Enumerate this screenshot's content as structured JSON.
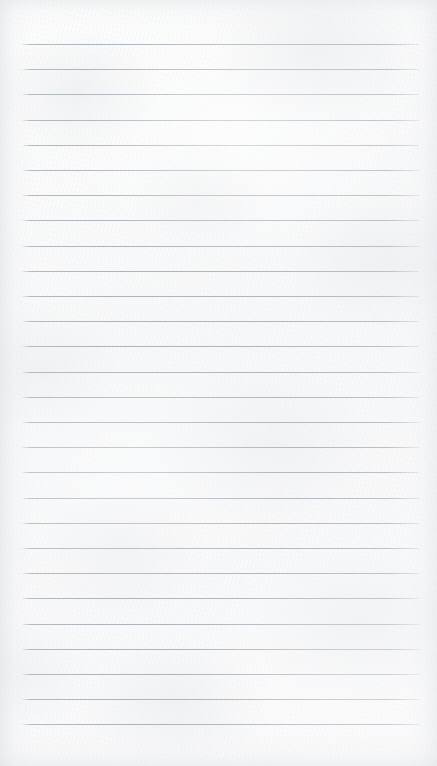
{
  "document": {
    "kind": "ruled-notebook-page",
    "title": "",
    "body_text": "",
    "paper_color": "#fbfbfb",
    "rule_color": "#b0b7bd",
    "page_width": 437,
    "page_height": 766
  },
  "ruling": {
    "line_count": 28,
    "first_line_y": 44,
    "line_spacing": 25.2,
    "line_left_x": 22,
    "line_right_x": 419,
    "line_thickness": 1,
    "has_margin_rule": false,
    "top_margin": 44,
    "bottom_margin": 49
  },
  "content": {
    "lines": [
      {
        "index": 1,
        "text": ""
      },
      {
        "index": 2,
        "text": ""
      },
      {
        "index": 3,
        "text": ""
      },
      {
        "index": 4,
        "text": ""
      },
      {
        "index": 5,
        "text": ""
      },
      {
        "index": 6,
        "text": ""
      },
      {
        "index": 7,
        "text": ""
      },
      {
        "index": 8,
        "text": ""
      },
      {
        "index": 9,
        "text": ""
      },
      {
        "index": 10,
        "text": ""
      },
      {
        "index": 11,
        "text": ""
      },
      {
        "index": 12,
        "text": ""
      },
      {
        "index": 13,
        "text": ""
      },
      {
        "index": 14,
        "text": ""
      },
      {
        "index": 15,
        "text": ""
      },
      {
        "index": 16,
        "text": ""
      },
      {
        "index": 17,
        "text": ""
      },
      {
        "index": 18,
        "text": ""
      },
      {
        "index": 19,
        "text": ""
      },
      {
        "index": 20,
        "text": ""
      },
      {
        "index": 21,
        "text": ""
      },
      {
        "index": 22,
        "text": ""
      },
      {
        "index": 23,
        "text": ""
      },
      {
        "index": 24,
        "text": ""
      },
      {
        "index": 25,
        "text": ""
      },
      {
        "index": 26,
        "text": ""
      },
      {
        "index": 27,
        "text": ""
      },
      {
        "index": 28,
        "text": ""
      }
    ]
  }
}
